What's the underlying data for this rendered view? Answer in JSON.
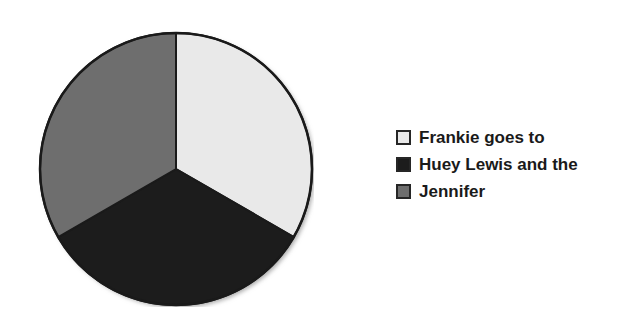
{
  "chart_data": {
    "type": "pie",
    "title": "",
    "categories": [
      "Frankie goes to",
      "Huey Lewis and the",
      "Jennifer"
    ],
    "values": [
      33.33,
      33.33,
      33.33
    ],
    "units": "percent",
    "slice_colors": [
      "#E9E9E9",
      "#1C1C1C",
      "#6E6E6E"
    ],
    "start_angle_deg": 0,
    "direction": "clockwise",
    "legend_position": "right",
    "grid": false,
    "border_color": "#1A1A1A",
    "background": "#FFFFFF",
    "slices": [
      {
        "label": "Frankie goes to",
        "value": 33.33,
        "color": "#E9E9E9",
        "start_deg": 0,
        "end_deg": 120
      },
      {
        "label": "Huey Lewis and the",
        "value": 33.33,
        "color": "#1C1C1C",
        "start_deg": 120,
        "end_deg": 240
      },
      {
        "label": "Jennifer",
        "value": 33.33,
        "color": "#6E6E6E",
        "start_deg": 240,
        "end_deg": 360
      }
    ]
  },
  "legend": {
    "items": [
      {
        "label": "Frankie goes to",
        "color": "#E9E9E9"
      },
      {
        "label": "Huey Lewis and the",
        "color": "#1C1C1C"
      },
      {
        "label": "Jennifer",
        "color": "#6E6E6E"
      }
    ]
  }
}
